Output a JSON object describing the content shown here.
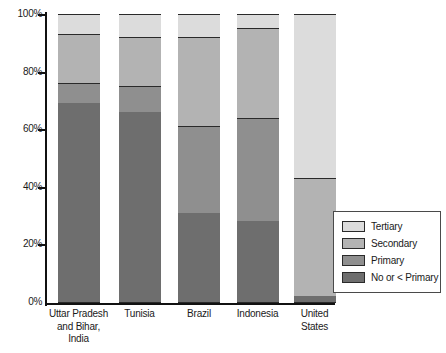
{
  "chart_data": {
    "type": "bar",
    "subtype": "stacked-bar-100-percent",
    "title": "",
    "xlabel": "",
    "ylabel": "",
    "ylim": [
      0,
      100
    ],
    "yticks": [
      0,
      20,
      40,
      60,
      80,
      100
    ],
    "ytick_labels": [
      "0%",
      "20%",
      "40%",
      "60%",
      "80%",
      "100%"
    ],
    "grid": false,
    "legend_position": "bottom-right",
    "stack_order_bottom_to_top": [
      "No or < Primary",
      "Primary",
      "Secondary",
      "Tertiary"
    ],
    "categories": [
      "Uttar Pradesh and Bihar, India",
      "Tunisia",
      "Brazil",
      "Indonesia",
      "United States"
    ],
    "category_labels": [
      [
        "Uttar Pradesh",
        "and Bihar,",
        "India"
      ],
      [
        "Tunisia"
      ],
      [
        "Brazil"
      ],
      [
        "Indonesia"
      ],
      [
        "United",
        "States"
      ]
    ],
    "series": [
      {
        "name": "No or < Primary",
        "color": "#6e6e6e",
        "values": [
          69,
          66,
          31,
          28,
          2
        ]
      },
      {
        "name": "Primary",
        "color": "#8f8f8f",
        "values": [
          7,
          9,
          30,
          36,
          0
        ]
      },
      {
        "name": "Secondary",
        "color": "#b3b3b3",
        "values": [
          17,
          17,
          31,
          31,
          41
        ]
      },
      {
        "name": "Tertiary",
        "color": "#dcdcdc",
        "values": [
          7,
          8,
          8,
          5,
          57
        ]
      }
    ],
    "cumulative_tops": {
      "No or < Primary": [
        69,
        66,
        31,
        28,
        2
      ],
      "Primary": [
        76,
        75,
        61,
        64,
        2
      ],
      "Secondary": [
        93,
        92,
        92,
        95,
        43
      ],
      "Tertiary": [
        100,
        100,
        100,
        100,
        100
      ]
    }
  },
  "legend": {
    "items": [
      {
        "label": "Tertiary",
        "color": "#dcdcdc"
      },
      {
        "label": "Secondary",
        "color": "#b3b3b3"
      },
      {
        "label": "Primary",
        "color": "#8f8f8f"
      },
      {
        "label": "No or < Primary",
        "color": "#6e6e6e"
      }
    ]
  },
  "axis": {
    "y_labels": [
      "100%",
      "80%",
      "60%",
      "40%",
      "20%",
      "0%"
    ]
  }
}
